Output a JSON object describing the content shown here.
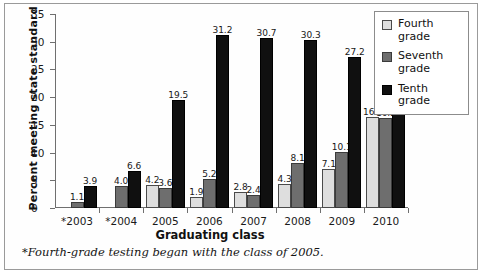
{
  "chart_data": {
    "type": "bar",
    "title": "",
    "xlabel": "Graduating class",
    "ylabel": "Percent meeting state standard",
    "categories": [
      "*2003",
      "*2004",
      "2005",
      "2006",
      "2007",
      "2008",
      "2009",
      "2010"
    ],
    "series": [
      {
        "name": "Fourth grade",
        "color": "#dedede",
        "values": [
          null,
          null,
          4.2,
          1.9,
          2.8,
          4.3,
          7.1,
          16.4
        ]
      },
      {
        "name": "Seventh grade",
        "color": "#6e6e6e",
        "values": [
          1.1,
          4.0,
          3.6,
          5.2,
          2.4,
          8.1,
          10.1,
          16.2
        ]
      },
      {
        "name": "Tenth grade",
        "color": "#101010",
        "values": [
          3.9,
          6.6,
          19.5,
          31.2,
          30.7,
          30.3,
          27.2,
          17.5
        ]
      }
    ],
    "ylim": [
      0,
      35
    ],
    "yticks": [
      0,
      5,
      10,
      15,
      20,
      25,
      30,
      35
    ],
    "ytick_labels": [
      "0",
      "5",
      "10",
      "15",
      "20",
      "25",
      "30",
      "35"
    ],
    "grid": false,
    "legend_position": "top-right",
    "data_labels": true,
    "footnote": "*Fourth-grade testing began with the class of 2005."
  },
  "legend": {
    "items": [
      {
        "label": "Fourth grade",
        "color": "#dedede"
      },
      {
        "label": "Seventh grade",
        "color": "#6e6e6e"
      },
      {
        "label": "Tenth grade",
        "color": "#101010"
      }
    ]
  }
}
